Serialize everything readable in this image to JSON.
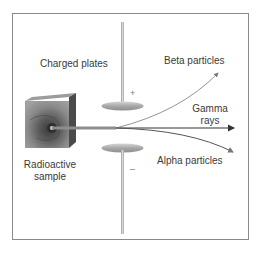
{
  "diagram": {
    "type": "physics-apparatus",
    "labels": {
      "charged_plates": "Charged plates",
      "beta": "Beta particles",
      "gamma_line1": "Gamma",
      "gamma_line2": "rays",
      "alpha": "Alpha particles",
      "sample_line1": "Radioactive",
      "sample_line2": "sample",
      "positive_sign": "+",
      "negative_sign": "–"
    },
    "colors": {
      "frame": "#8a8a8a",
      "plate": "#b5b5b5",
      "rod": "#c2c2c2",
      "ray": "#555555",
      "sample_block": "#6e6e6e",
      "text": "#3a3a3a"
    }
  }
}
